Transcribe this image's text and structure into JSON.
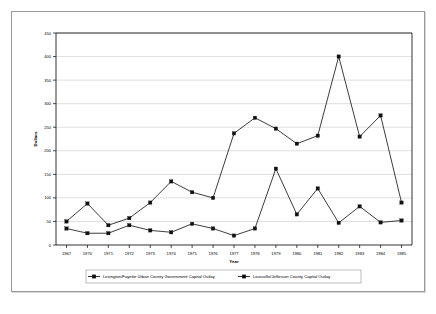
{
  "chart_data": {
    "type": "line",
    "title": "",
    "xlabel": "Year",
    "ylabel": "Dollars",
    "ylim": [
      0,
      450
    ],
    "ytick_step": 50,
    "yticks": [
      0,
      50,
      100,
      150,
      200,
      250,
      300,
      350,
      400,
      450
    ],
    "grid": true,
    "legend_position": "bottom",
    "categories": [
      "1967",
      "1970",
      "1971",
      "1972",
      "1973",
      "1974",
      "1975",
      "1976",
      "1977",
      "1978",
      "1979",
      "1980",
      "1981",
      "1982",
      "1983",
      "1984",
      "1985"
    ],
    "series": [
      {
        "name": "Lexington/Fayette Urban County Government Capital Outlay",
        "marker": "square",
        "color": "#111111",
        "values": [
          35,
          25,
          25,
          42,
          31,
          27,
          45,
          35,
          20,
          35,
          162,
          65,
          120,
          47,
          82,
          48,
          52
        ]
      },
      {
        "name": "Louisville/Jefferson County Capital Outlay",
        "marker": "square",
        "color": "#111111",
        "values": [
          50,
          88,
          42,
          57,
          90,
          135,
          112,
          100,
          237,
          270,
          247,
          215,
          232,
          400,
          230,
          275,
          90
        ]
      }
    ]
  },
  "axes": {
    "y_title": "Dollars",
    "x_title": "Year"
  },
  "legend": {
    "entries": [
      {
        "label": "Lexington/Fayette Urban County Government Capital Outlay"
      },
      {
        "label": "Louisville/Jefferson County Capital Outlay"
      }
    ]
  }
}
